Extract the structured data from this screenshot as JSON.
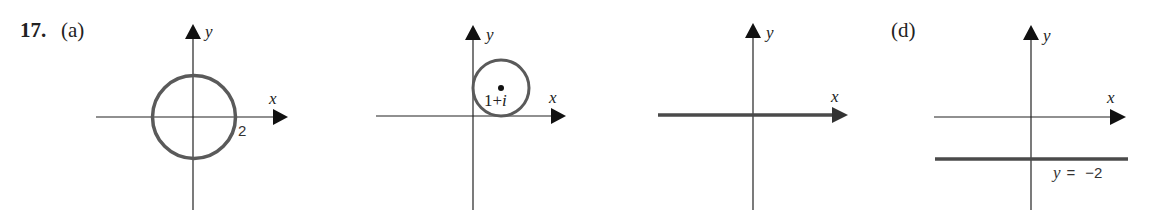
{
  "problem": {
    "number": "17.",
    "colors": {
      "axis": "#1a1a1a",
      "curve": "#5a5a5a",
      "text": "#222222"
    }
  },
  "panels": [
    {
      "label": "(a)",
      "x_axis_label": "x",
      "y_axis_label": "y",
      "shape": "circle",
      "description": "Circle centered at origin with radius 2",
      "annotation": "2"
    },
    {
      "label": "(b)",
      "label_visible": false,
      "x_axis_label": "x",
      "y_axis_label": "y",
      "shape": "circle",
      "description": "Circle centered at 1+i tangent to both axes",
      "annotation": "1+i"
    },
    {
      "label": "(c)",
      "label_visible": false,
      "x_axis_label": "x",
      "y_axis_label": "y",
      "shape": "line",
      "description": "Entire x-axis highlighted (y = 0)"
    },
    {
      "label": "(d)",
      "x_axis_label": "x",
      "y_axis_label": "y",
      "shape": "line",
      "description": "Horizontal line y = -2",
      "annotation": "y = −2"
    }
  ]
}
